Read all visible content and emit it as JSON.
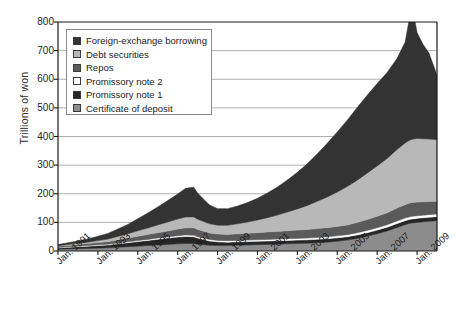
{
  "chart_data": {
    "type": "area",
    "stacked": true,
    "title": "",
    "subtitle": "",
    "xlabel": "",
    "ylabel": "Trillions of won",
    "ylim": [
      0,
      800
    ],
    "yticks": [
      0,
      100,
      200,
      300,
      400,
      500,
      600,
      700,
      800
    ],
    "ytick_labels": [
      "0",
      "100",
      "200",
      "300",
      "400",
      "500",
      "600",
      "700",
      "800"
    ],
    "grid": true,
    "grid_axis": "y",
    "legend_position": "top-left",
    "xtick_labels": [
      "Jan. 1991",
      "Jan. 1993",
      "Jan. 1995",
      "Jan. 1997",
      "Jan. 1999",
      "Jan. 2001",
      "Jan. 2003",
      "Jan. 2005",
      "Jan. 2007",
      "Jan. 2009"
    ],
    "x_start": "Jan. 1991",
    "x_end": "Jan. 2010",
    "x": [
      1991.0,
      1991.5,
      1992.0,
      1992.5,
      1993.0,
      1993.5,
      1994.0,
      1994.5,
      1995.0,
      1995.5,
      1996.0,
      1996.5,
      1997.0,
      1997.4,
      1997.8,
      1998.0,
      1998.3,
      1998.6,
      1999.0,
      1999.5,
      2000.0,
      2000.5,
      2001.0,
      2001.5,
      2002.0,
      2002.5,
      2003.0,
      2003.5,
      2004.0,
      2004.5,
      2005.0,
      2005.5,
      2006.0,
      2006.5,
      2007.0,
      2007.5,
      2008.0,
      2008.4,
      2008.6,
      2008.75,
      2008.9,
      2009.0,
      2009.3,
      2009.6,
      2010.0
    ],
    "series": [
      {
        "name": "Certificate of deposit",
        "color": "#8c8c8c",
        "values": [
          6,
          7,
          8,
          9,
          10,
          11,
          13,
          15,
          17,
          19,
          21,
          23,
          25,
          26,
          26,
          24,
          22,
          20,
          19,
          19,
          20,
          21,
          22,
          23,
          24,
          25,
          26,
          27,
          29,
          31,
          34,
          38,
          44,
          52,
          60,
          70,
          82,
          92,
          96,
          98,
          99,
          100,
          102,
          104,
          106
        ]
      },
      {
        "name": "Promissory note 1",
        "color": "#262626",
        "values": [
          5,
          6,
          7,
          8,
          9,
          10,
          12,
          14,
          16,
          18,
          20,
          22,
          24,
          25,
          24,
          21,
          18,
          15,
          13,
          12,
          12,
          12,
          12,
          12,
          12,
          12,
          12,
          12,
          12,
          12,
          12,
          12,
          12,
          12,
          13,
          13,
          14,
          14,
          14,
          14,
          14,
          14,
          14,
          14,
          14
        ]
      },
      {
        "name": "Promissory note 2",
        "color": "#ffffff",
        "values": [
          1.5,
          1.5,
          2,
          2,
          2.5,
          2.5,
          3,
          3,
          3.5,
          3.5,
          4,
          4,
          4.5,
          5,
          5,
          5,
          5,
          5,
          5,
          5,
          5,
          5,
          5,
          5.5,
          5.5,
          6,
          6,
          6,
          6.5,
          6.5,
          7,
          7,
          7.5,
          8,
          8,
          8.5,
          9,
          9,
          9,
          9,
          9,
          9,
          9,
          9,
          9
        ]
      },
      {
        "name": "Repos",
        "color": "#5a5a5a",
        "values": [
          4,
          5,
          6,
          7,
          8,
          9,
          11,
          13,
          15,
          17,
          19,
          21,
          23,
          25,
          26,
          25,
          24,
          23,
          22,
          22,
          23,
          24,
          25,
          26,
          27,
          28,
          29,
          30,
          31,
          32,
          33,
          34,
          36,
          38,
          40,
          42,
          45,
          47,
          48,
          48,
          48,
          48,
          47,
          46,
          45
        ]
      },
      {
        "name": "Debt securities",
        "color": "#b8b8b8",
        "values": [
          2,
          3,
          4,
          5,
          7,
          9,
          12,
          15,
          19,
          23,
          27,
          31,
          35,
          38,
          38,
          36,
          34,
          32,
          31,
          32,
          35,
          39,
          44,
          50,
          57,
          65,
          74,
          84,
          95,
          107,
          120,
          134,
          148,
          162,
          176,
          190,
          205,
          215,
          219,
          221,
          222,
          222,
          220,
          218,
          215
        ]
      },
      {
        "name": "Foreign-exchange borrowing",
        "color": "#333333",
        "values": [
          4,
          6,
          8,
          11,
          15,
          20,
          26,
          33,
          42,
          52,
          63,
          75,
          88,
          100,
          104,
          92,
          78,
          66,
          58,
          58,
          62,
          68,
          76,
          86,
          98,
          112,
          128,
          146,
          166,
          188,
          210,
          232,
          254,
          272,
          288,
          300,
          318,
          352,
          420,
          520,
          410,
          370,
          330,
          300,
          226
        ]
      }
    ],
    "totals_note": "Stacked total peaks near 720 in late 2008",
    "peak_total": 720,
    "end_total": 615
  },
  "axis": {
    "ylabel": "Trillions of won",
    "yticks": [
      "800",
      "700",
      "600",
      "500",
      "400",
      "300",
      "200",
      "100",
      "0"
    ],
    "xticks": [
      "Jan. 1991",
      "Jan. 1993",
      "Jan. 1995",
      "Jan. 1997",
      "Jan. 1999",
      "Jan. 2001",
      "Jan. 2003",
      "Jan. 2005",
      "Jan. 2007",
      "Jan. 2009"
    ]
  },
  "legend": {
    "items": [
      {
        "label": "Foreign-exchange borrowing",
        "color": "#333333"
      },
      {
        "label": "Debt securities",
        "color": "#b8b8b8"
      },
      {
        "label": "Repos",
        "color": "#5a5a5a"
      },
      {
        "label": "Promissory note 2",
        "color": "#ffffff"
      },
      {
        "label": "Promissory note 1",
        "color": "#262626"
      },
      {
        "label": "Certificate of deposit",
        "color": "#8c8c8c"
      }
    ]
  },
  "style": {
    "background": "#ffffff",
    "axis_color": "#1a1a1a",
    "grid_color": "#9a9a9a",
    "text_color": "#1e1e1e"
  }
}
